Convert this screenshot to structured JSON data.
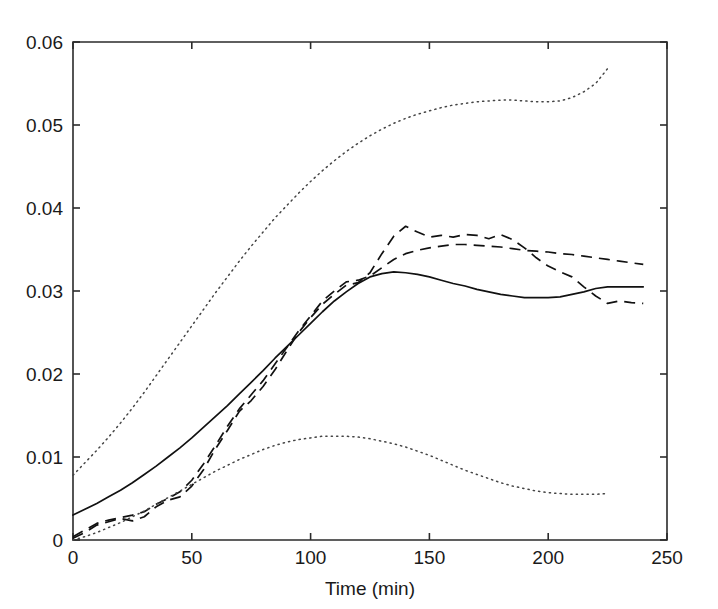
{
  "chart_data": {
    "type": "line",
    "title": "",
    "xlabel": "Time (min)",
    "ylabel": "",
    "xlim": [
      0,
      250
    ],
    "ylim": [
      0,
      0.06
    ],
    "grid": false,
    "legend": "none",
    "xticks": [
      0,
      50,
      100,
      150,
      200,
      250
    ],
    "xtick_labels": [
      "0",
      "50",
      "100",
      "150",
      "200",
      "250"
    ],
    "yticks": [
      0,
      0.01,
      0.02,
      0.03,
      0.04,
      0.05,
      0.06
    ],
    "ytick_labels": [
      "0",
      "0.01",
      "0.02",
      "0.03",
      "0.04",
      "0.05",
      "0.06"
    ],
    "series": [
      {
        "name": "model-mean",
        "style": "solid",
        "color": "#111111",
        "x": [
          0,
          5,
          10,
          15,
          20,
          25,
          30,
          35,
          40,
          45,
          50,
          55,
          60,
          65,
          70,
          75,
          80,
          85,
          90,
          95,
          100,
          105,
          110,
          115,
          120,
          125,
          130,
          135,
          140,
          145,
          150,
          155,
          160,
          165,
          170,
          175,
          180,
          185,
          190,
          195,
          200,
          205,
          210,
          215,
          220,
          225,
          230,
          235,
          240
        ],
        "y": [
          0.003,
          0.0037,
          0.0044,
          0.0052,
          0.006,
          0.0069,
          0.0079,
          0.0089,
          0.01,
          0.0111,
          0.0123,
          0.0136,
          0.0149,
          0.0162,
          0.0176,
          0.019,
          0.0204,
          0.0219,
          0.0233,
          0.0247,
          0.0261,
          0.0275,
          0.0288,
          0.0299,
          0.0309,
          0.0317,
          0.0321,
          0.0323,
          0.0322,
          0.032,
          0.0317,
          0.0313,
          0.0309,
          0.0306,
          0.0302,
          0.0299,
          0.0296,
          0.0294,
          0.0292,
          0.0292,
          0.0292,
          0.0293,
          0.0296,
          0.0299,
          0.0303,
          0.0305,
          0.0305,
          0.0305,
          0.0305
        ]
      },
      {
        "name": "experiment-run-1",
        "style": "dashed",
        "color": "#111111",
        "x": [
          0,
          5,
          10,
          15,
          20,
          25,
          30,
          35,
          40,
          45,
          50,
          55,
          60,
          65,
          70,
          75,
          80,
          85,
          90,
          95,
          100,
          105,
          110,
          115,
          120,
          125,
          130,
          135,
          140,
          145,
          150,
          155,
          160,
          165,
          170,
          175,
          180,
          185,
          190,
          195,
          200,
          205,
          210,
          215,
          220,
          225,
          230,
          235,
          240
        ],
        "y": [
          0.0002,
          0.0009,
          0.0018,
          0.0022,
          0.0026,
          0.0023,
          0.0028,
          0.004,
          0.0048,
          0.0052,
          0.0065,
          0.0085,
          0.011,
          0.0132,
          0.0155,
          0.0168,
          0.0185,
          0.0205,
          0.0228,
          0.025,
          0.0268,
          0.0284,
          0.0296,
          0.0307,
          0.031,
          0.0322,
          0.0345,
          0.0366,
          0.0378,
          0.0371,
          0.0365,
          0.0367,
          0.0365,
          0.0368,
          0.0367,
          0.0363,
          0.0368,
          0.0362,
          0.0352,
          0.034,
          0.033,
          0.0323,
          0.0317,
          0.0305,
          0.0294,
          0.0285,
          0.0288,
          0.0286,
          0.0285
        ]
      },
      {
        "name": "experiment-run-2",
        "style": "dashed",
        "color": "#111111",
        "x": [
          0,
          5,
          10,
          15,
          20,
          25,
          30,
          35,
          40,
          45,
          50,
          55,
          60,
          65,
          70,
          75,
          80,
          85,
          90,
          95,
          100,
          105,
          110,
          115,
          120,
          125,
          130,
          135,
          140,
          145,
          150,
          155,
          160,
          165,
          170,
          175,
          180,
          185,
          190,
          195,
          200,
          205,
          210,
          215,
          220,
          225,
          230,
          235,
          240
        ],
        "y": [
          0.0004,
          0.0012,
          0.002,
          0.0024,
          0.0027,
          0.003,
          0.0034,
          0.0043,
          0.005,
          0.0058,
          0.0072,
          0.0092,
          0.0114,
          0.0137,
          0.0158,
          0.0175,
          0.0192,
          0.0212,
          0.0232,
          0.0252,
          0.027,
          0.0288,
          0.03,
          0.0311,
          0.0313,
          0.0318,
          0.0328,
          0.0338,
          0.0345,
          0.0349,
          0.0352,
          0.0354,
          0.0356,
          0.0356,
          0.0355,
          0.0354,
          0.0353,
          0.0351,
          0.0349,
          0.0348,
          0.0347,
          0.0345,
          0.0344,
          0.0342,
          0.034,
          0.0338,
          0.0336,
          0.0334,
          0.0332
        ]
      },
      {
        "name": "upper-confidence-bound",
        "style": "dotted",
        "color": "#444444",
        "x": [
          0,
          5,
          10,
          15,
          20,
          25,
          30,
          35,
          40,
          45,
          50,
          55,
          60,
          65,
          70,
          75,
          80,
          85,
          90,
          95,
          100,
          105,
          110,
          115,
          120,
          125,
          130,
          135,
          140,
          145,
          150,
          155,
          160,
          165,
          170,
          175,
          180,
          185,
          190,
          195,
          200,
          205,
          210,
          215,
          220,
          225
        ],
        "y": [
          0.0078,
          0.0093,
          0.0108,
          0.0124,
          0.0141,
          0.0159,
          0.0178,
          0.0198,
          0.0218,
          0.0238,
          0.0258,
          0.0278,
          0.0298,
          0.0317,
          0.0336,
          0.0354,
          0.0371,
          0.0388,
          0.0403,
          0.0418,
          0.0432,
          0.0445,
          0.0457,
          0.0468,
          0.0478,
          0.0487,
          0.0495,
          0.0502,
          0.0508,
          0.0513,
          0.0517,
          0.0521,
          0.0524,
          0.0526,
          0.0528,
          0.0529,
          0.053,
          0.053,
          0.0529,
          0.0528,
          0.0528,
          0.0529,
          0.0533,
          0.054,
          0.055,
          0.0568
        ]
      },
      {
        "name": "lower-confidence-bound",
        "style": "dotted",
        "color": "#444444",
        "x": [
          0,
          5,
          10,
          15,
          20,
          25,
          30,
          35,
          40,
          45,
          50,
          55,
          60,
          65,
          70,
          75,
          80,
          85,
          90,
          95,
          100,
          105,
          110,
          115,
          120,
          125,
          130,
          135,
          140,
          145,
          150,
          155,
          160,
          165,
          170,
          175,
          180,
          185,
          190,
          195,
          200,
          205,
          210,
          215,
          220,
          225
        ],
        "y": [
          0.0,
          0.0004,
          0.0009,
          0.0015,
          0.0021,
          0.0028,
          0.0035,
          0.0043,
          0.0051,
          0.0059,
          0.0067,
          0.0075,
          0.0083,
          0.009,
          0.0097,
          0.0103,
          0.0109,
          0.0114,
          0.0118,
          0.0121,
          0.0123,
          0.0125,
          0.0125,
          0.0125,
          0.0124,
          0.0122,
          0.0119,
          0.0116,
          0.0112,
          0.0107,
          0.0102,
          0.0096,
          0.009,
          0.0084,
          0.0079,
          0.0074,
          0.0069,
          0.0065,
          0.0062,
          0.0059,
          0.0057,
          0.0056,
          0.0055,
          0.0055,
          0.0055,
          0.0056
        ]
      }
    ]
  },
  "plot_box": {
    "left": 73,
    "right": 667,
    "top": 42,
    "bottom": 540
  }
}
